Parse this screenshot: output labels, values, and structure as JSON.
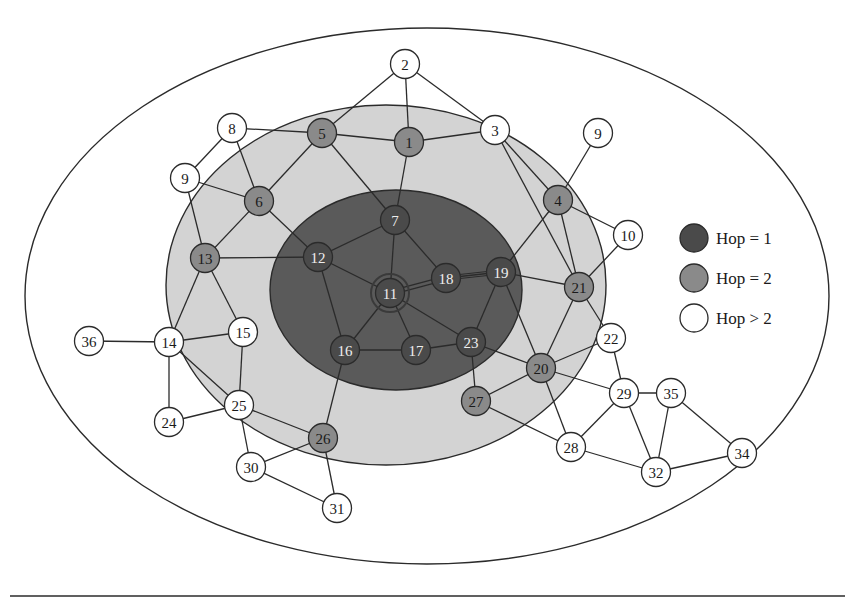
{
  "diagram": {
    "title": "",
    "colors": {
      "hop1_fill": "#4a4a4a",
      "hop2_fill": "#8a8a8a",
      "hop_other_fill": "#ffffff",
      "inner_region": "#5a5a5a",
      "middle_region": "#d3d3d3",
      "outer_region": "#ffffff",
      "stroke": "#2b2b2b",
      "hop1_text": "#eeeeee",
      "hop2_text": "#1a1a1a",
      "hop_other_text": "#1a1a1a"
    },
    "regions": [
      {
        "name": "outer-region",
        "cx": 427,
        "cy": 296,
        "rx": 402,
        "ry": 268
      },
      {
        "name": "hop2-region",
        "cx": 386,
        "cy": 285,
        "rx": 220,
        "ry": 180
      },
      {
        "name": "hop1-region",
        "cx": 396,
        "cy": 290,
        "rx": 126,
        "ry": 100
      }
    ],
    "source_node": "11",
    "nodes": [
      {
        "id": "n1",
        "label": "1",
        "x": 409,
        "y": 142,
        "hop": 2
      },
      {
        "id": "n2",
        "label": "2",
        "x": 405,
        "y": 64,
        "hop": 3
      },
      {
        "id": "n3",
        "label": "3",
        "x": 495,
        "y": 130,
        "hop": 3
      },
      {
        "id": "n4",
        "label": "4",
        "x": 558,
        "y": 200,
        "hop": 2
      },
      {
        "id": "n5",
        "label": "5",
        "x": 322,
        "y": 133,
        "hop": 2
      },
      {
        "id": "n6",
        "label": "6",
        "x": 259,
        "y": 201,
        "hop": 2
      },
      {
        "id": "n7",
        "label": "7",
        "x": 395,
        "y": 220,
        "hop": 1
      },
      {
        "id": "n8",
        "label": "8",
        "x": 232,
        "y": 128,
        "hop": 3
      },
      {
        "id": "n9a",
        "label": "9",
        "x": 185,
        "y": 178,
        "hop": 3
      },
      {
        "id": "n9b",
        "label": "9",
        "x": 598,
        "y": 133,
        "hop": 3
      },
      {
        "id": "n10",
        "label": "10",
        "x": 628,
        "y": 235,
        "hop": 3
      },
      {
        "id": "n11",
        "label": "11",
        "x": 390,
        "y": 293,
        "hop": 1,
        "source": true
      },
      {
        "id": "n12",
        "label": "12",
        "x": 318,
        "y": 257,
        "hop": 1
      },
      {
        "id": "n13",
        "label": "13",
        "x": 205,
        "y": 258,
        "hop": 2
      },
      {
        "id": "n14",
        "label": "14",
        "x": 169,
        "y": 342,
        "hop": 3
      },
      {
        "id": "n15",
        "label": "15",
        "x": 243,
        "y": 332,
        "hop": 3
      },
      {
        "id": "n16",
        "label": "16",
        "x": 345,
        "y": 350,
        "hop": 1
      },
      {
        "id": "n17",
        "label": "17",
        "x": 416,
        "y": 350,
        "hop": 1
      },
      {
        "id": "n18",
        "label": "18",
        "x": 446,
        "y": 278,
        "hop": 1
      },
      {
        "id": "n19",
        "label": "19",
        "x": 501,
        "y": 272,
        "hop": 1
      },
      {
        "id": "n20",
        "label": "20",
        "x": 541,
        "y": 368,
        "hop": 2
      },
      {
        "id": "n21",
        "label": "21",
        "x": 579,
        "y": 287,
        "hop": 2
      },
      {
        "id": "n22",
        "label": "22",
        "x": 611,
        "y": 338,
        "hop": 3
      },
      {
        "id": "n23",
        "label": "23",
        "x": 471,
        "y": 342,
        "hop": 1
      },
      {
        "id": "n24",
        "label": "24",
        "x": 169,
        "y": 422,
        "hop": 3
      },
      {
        "id": "n25",
        "label": "25",
        "x": 239,
        "y": 405,
        "hop": 3
      },
      {
        "id": "n26",
        "label": "26",
        "x": 323,
        "y": 438,
        "hop": 2
      },
      {
        "id": "n27",
        "label": "27",
        "x": 476,
        "y": 401,
        "hop": 2
      },
      {
        "id": "n28",
        "label": "28",
        "x": 571,
        "y": 447,
        "hop": 3
      },
      {
        "id": "n29",
        "label": "29",
        "x": 624,
        "y": 393,
        "hop": 3
      },
      {
        "id": "n30",
        "label": "30",
        "x": 251,
        "y": 467,
        "hop": 3
      },
      {
        "id": "n31",
        "label": "31",
        "x": 337,
        "y": 508,
        "hop": 3
      },
      {
        "id": "n32",
        "label": "32",
        "x": 656,
        "y": 472,
        "hop": 3
      },
      {
        "id": "n34",
        "label": "34",
        "x": 742,
        "y": 453,
        "hop": 3
      },
      {
        "id": "n35",
        "label": "35",
        "x": 671,
        "y": 393,
        "hop": 3
      },
      {
        "id": "n36",
        "label": "36",
        "x": 89,
        "y": 341,
        "hop": 3
      }
    ],
    "edges": [
      [
        "n2",
        "n5"
      ],
      [
        "n2",
        "n1"
      ],
      [
        "n2",
        "n3"
      ],
      [
        "n8",
        "n5"
      ],
      [
        "n8",
        "n9a"
      ],
      [
        "n8",
        "n6"
      ],
      [
        "n5",
        "n1"
      ],
      [
        "n5",
        "n6"
      ],
      [
        "n5",
        "n7"
      ],
      [
        "n1",
        "n3"
      ],
      [
        "n1",
        "n7"
      ],
      [
        "n3",
        "n4"
      ],
      [
        "n3",
        "n21"
      ],
      [
        "n9a",
        "n6"
      ],
      [
        "n9a",
        "n13"
      ],
      [
        "n9b",
        "n4"
      ],
      [
        "n6",
        "n13"
      ],
      [
        "n6",
        "n12"
      ],
      [
        "n4",
        "n10"
      ],
      [
        "n4",
        "n19"
      ],
      [
        "n4",
        "n21"
      ],
      [
        "n7",
        "n12"
      ],
      [
        "n7",
        "n11"
      ],
      [
        "n7",
        "n18"
      ],
      [
        "n13",
        "n12"
      ],
      [
        "n13",
        "n14"
      ],
      [
        "n13",
        "n15"
      ],
      [
        "n12",
        "n11"
      ],
      [
        "n12",
        "n16"
      ],
      [
        "n11",
        "n16"
      ],
      [
        "n11",
        "n17"
      ],
      [
        "n11",
        "n23"
      ],
      [
        "n18",
        "n19"
      ],
      [
        "n19",
        "n21"
      ],
      [
        "n19",
        "n23"
      ],
      [
        "n19",
        "n20"
      ],
      [
        "n10",
        "n21"
      ],
      [
        "n21",
        "n20"
      ],
      [
        "n21",
        "n22"
      ],
      [
        "n16",
        "n17"
      ],
      [
        "n17",
        "n23"
      ],
      [
        "n23",
        "n20"
      ],
      [
        "n23",
        "n27"
      ],
      [
        "n20",
        "n22"
      ],
      [
        "n20",
        "n27"
      ],
      [
        "n20",
        "n28"
      ],
      [
        "n20",
        "n29"
      ],
      [
        "n22",
        "n29"
      ],
      [
        "n27",
        "n28"
      ],
      [
        "n28",
        "n29"
      ],
      [
        "n28",
        "n32"
      ],
      [
        "n29",
        "n35"
      ],
      [
        "n29",
        "n32"
      ],
      [
        "n35",
        "n32"
      ],
      [
        "n35",
        "n34"
      ],
      [
        "n32",
        "n34"
      ],
      [
        "n36",
        "n14"
      ],
      [
        "n14",
        "n15"
      ],
      [
        "n14",
        "n24"
      ],
      [
        "n14",
        "n25"
      ],
      [
        "n15",
        "n25"
      ],
      [
        "n24",
        "n25"
      ],
      [
        "n25",
        "n26"
      ],
      [
        "n25",
        "n30"
      ],
      [
        "n16",
        "n26"
      ],
      [
        "n26",
        "n30"
      ],
      [
        "n26",
        "n31"
      ],
      [
        "n30",
        "n31"
      ]
    ],
    "double_edges": [
      [
        "n11",
        "n18"
      ],
      [
        "n18",
        "n19"
      ]
    ],
    "legend": {
      "items": [
        {
          "label": "Hop = 1",
          "hop": 1
        },
        {
          "label": "Hop = 2",
          "hop": 2
        },
        {
          "label": "Hop > 2",
          "hop": 3
        }
      ]
    },
    "footer_rule": {
      "x1": 10,
      "x2": 845,
      "y": 596
    }
  }
}
